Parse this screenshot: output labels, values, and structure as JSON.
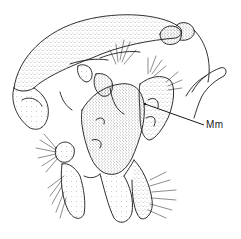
{
  "figure": {
    "labels": [
      {
        "id": "mm",
        "text": "Mm",
        "x": 208,
        "y": 120
      }
    ],
    "colors": {
      "ink": "#1a1a1a",
      "background": "#ffffff"
    }
  }
}
